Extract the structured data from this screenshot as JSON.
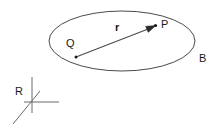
{
  "figure": {
    "type": "geometry-diagram",
    "background_color": "#ffffff",
    "stroke_color": "#4a4a4a",
    "text_color": "#1a1a1a",
    "body": {
      "name": "ellipse-body",
      "label": "B",
      "label_position": {
        "x": 199,
        "y": 62
      },
      "center": {
        "x": 122,
        "y": 41
      },
      "radius_x": 73,
      "radius_y": 30
    },
    "points": [
      {
        "name": "point-q",
        "label": "Q",
        "label_position": {
          "x": 66,
          "y": 47
        },
        "dot_position": {
          "x": 76,
          "y": 57
        }
      },
      {
        "name": "point-p",
        "label": "P",
        "label_position": {
          "x": 161,
          "y": 28
        },
        "dot_position": {
          "x": 155,
          "y": 26
        }
      }
    ],
    "vector": {
      "name": "vector-r",
      "label": "r",
      "label_position": {
        "x": 115,
        "y": 31
      },
      "from": {
        "x": 76,
        "y": 57
      },
      "to": {
        "x": 155,
        "y": 26
      },
      "arrow": "single-head",
      "bold_label": true
    },
    "frame": {
      "name": "reference-frame-r",
      "label": "R",
      "label_position": {
        "x": 15,
        "y": 95
      },
      "origin": {
        "x": 32,
        "y": 105
      },
      "axes": [
        {
          "name": "axis-vertical",
          "to": {
            "x": 32,
            "y": 77
          }
        },
        {
          "name": "axis-horizontal",
          "to": {
            "x": 59,
            "y": 102
          }
        },
        {
          "name": "axis-diagonal",
          "to": {
            "x": 13,
            "y": 124
          }
        }
      ]
    }
  }
}
